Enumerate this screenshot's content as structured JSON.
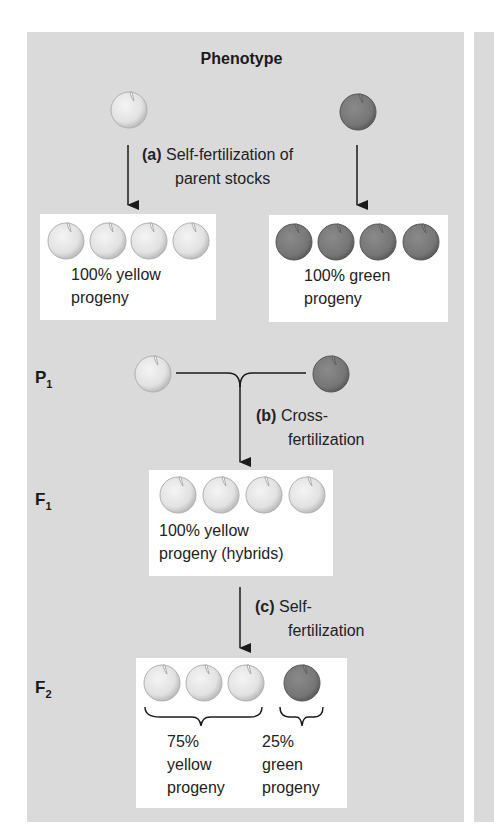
{
  "title": "Phenotype",
  "colors": {
    "panel_bg": "#dadada",
    "box_bg": "#ffffff",
    "yellow_pea": "#e6e6e6",
    "yellow_pea_edge": "#bdbdbd",
    "green_pea": "#7b7b7b",
    "green_pea_edge": "#5e5e5e",
    "line": "#1a1a1a"
  },
  "step_a": {
    "letter": "(a)",
    "line1": "Self-fertilization of",
    "line2": "parent stocks"
  },
  "parent_yellow_box": {
    "pea_count": 4,
    "line1": "100% yellow",
    "line2": "progeny"
  },
  "parent_green_box": {
    "pea_count": 4,
    "line1": "100% green",
    "line2": "progeny"
  },
  "generations": {
    "p1": {
      "letter": "P",
      "sub": "1"
    },
    "f1": {
      "letter": "F",
      "sub": "1"
    },
    "f2": {
      "letter": "F",
      "sub": "2"
    }
  },
  "step_b": {
    "letter": "(b)",
    "line1": "Cross-",
    "line2": "fertilization"
  },
  "f1_box": {
    "pea_count": 4,
    "line1": "100% yellow",
    "line2": "progeny (hybrids)"
  },
  "step_c": {
    "letter": "(c)",
    "line1": "Self-",
    "line2": "fertilization"
  },
  "f2_box": {
    "yellow": {
      "percent": "75%",
      "line1": "yellow",
      "line2": "progeny",
      "pea_count": 3
    },
    "green": {
      "percent": "25%",
      "line1": "green",
      "line2": "progeny",
      "pea_count": 1
    }
  }
}
